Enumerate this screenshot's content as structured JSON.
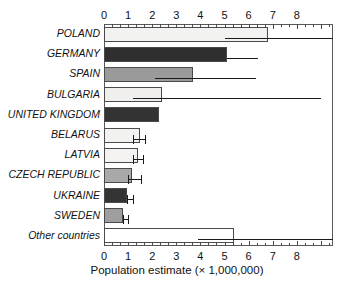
{
  "chart_data": {
    "type": "bar",
    "orientation": "horizontal",
    "title": "",
    "xlabel": "Population estimate (× 1,000,000)",
    "ylabel": "",
    "xlim": [
      0,
      9.5
    ],
    "xticks": [
      0,
      1,
      2,
      3,
      4,
      5,
      6,
      7,
      8
    ],
    "xtick_labels": [
      "0",
      "1",
      "2",
      "3",
      "4",
      "5",
      "6",
      "7",
      "8"
    ],
    "minor_ticks_per_interval": 2,
    "grid": false,
    "legend": false,
    "axis_top": true,
    "axis_bottom": true,
    "categories": [
      "POLAND",
      "GERMANY",
      "SPAIN",
      "BULGARIA",
      "UNITED KINGDOM",
      "BELARUS",
      "LATVIA",
      "CZECH REPUBLIC",
      "UKRAINE",
      "SWEDEN",
      "Other countries"
    ],
    "values": [
      6.8,
      5.1,
      3.7,
      2.4,
      2.3,
      1.5,
      1.4,
      1.15,
      0.95,
      0.8,
      5.4
    ],
    "error_low": [
      5.0,
      5.1,
      2.1,
      1.2,
      null,
      1.2,
      1.2,
      1.0,
      0.95,
      0.8,
      3.9
    ],
    "error_high": [
      9.5,
      6.4,
      6.3,
      9.0,
      null,
      1.7,
      1.6,
      1.55,
      1.2,
      1.0,
      9.5
    ],
    "bar_fills": [
      "#f2f2f0",
      "#2f2f2f",
      "#9a9a9a",
      "#f0efee",
      "#333333",
      "#f2f2f0",
      "#f4f3f2",
      "#a9a9a9",
      "#343434",
      "#9e9e9e",
      "#ffffff"
    ],
    "bar_edge_color": "#4a4a4a",
    "error_color": "#1a1a1a",
    "background": "#ffffff"
  },
  "axis": {
    "x_title": "Population estimate (× 1,000,000)"
  }
}
